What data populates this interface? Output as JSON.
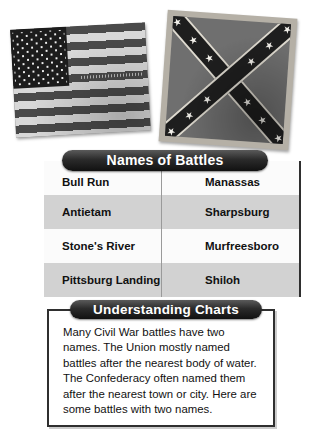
{
  "flags": {
    "us_flag_name": "united-states-flag",
    "confederate_flag_name": "confederate-battle-flag"
  },
  "battles_table": {
    "banner_label": "Names of Battles",
    "rows": [
      {
        "union": "Bull Run",
        "confederate": "Manassas"
      },
      {
        "union": "Antietam",
        "confederate": "Sharpsburg"
      },
      {
        "union": "Stone's River",
        "confederate": "Murfreesboro"
      },
      {
        "union": "Pittsburg Landing",
        "confederate": "Shiloh"
      }
    ]
  },
  "understanding": {
    "banner_label": "Understanding Charts",
    "paragraph": "Many Civil War battles have two names. The Union mostly named battles after the nearest body of water. The Confederacy often named them after the nearest town or city. Here are some battles with two names."
  },
  "colors": {
    "banner_dark": "#111111",
    "row_light": "#fbfbfb",
    "row_dark": "#d2d2d2",
    "border_dark": "#2f2f2f"
  }
}
